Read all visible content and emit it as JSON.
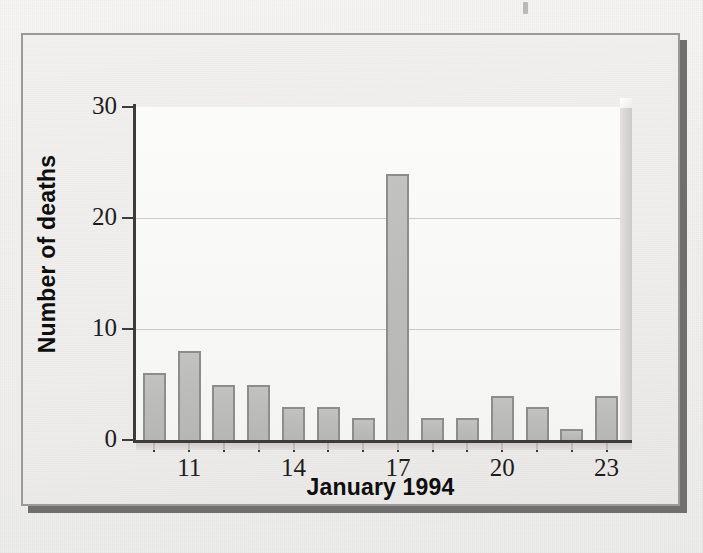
{
  "figure": {
    "alt_description": "Bar chart of number of deaths per day, January 1994"
  },
  "chart_data": {
    "type": "bar",
    "title": "",
    "subtitle": "",
    "xlabel": "January 1994",
    "ylabel": "Number of deaths",
    "categories": [
      "10",
      "11",
      "12",
      "13",
      "14",
      "15",
      "16",
      "17",
      "18",
      "19",
      "20",
      "21",
      "22",
      "23"
    ],
    "values": [
      6,
      8,
      5,
      5,
      3,
      3,
      2,
      24,
      2,
      2,
      4,
      3,
      1,
      4
    ],
    "series": [
      {
        "name": "Number of deaths",
        "values": [
          6,
          8,
          5,
          5,
          3,
          3,
          2,
          24,
          2,
          2,
          4,
          3,
          1,
          4
        ]
      }
    ],
    "ylim": [
      0,
      30
    ],
    "yticks": [
      0,
      10,
      20,
      30
    ],
    "ytick_labels": [
      "0",
      "10",
      "20",
      "30"
    ],
    "xtick_categories": [
      "11",
      "14",
      "17",
      "20",
      "23"
    ],
    "xtick_labels": [
      "11",
      "14",
      "17",
      "20",
      "23"
    ],
    "grid": "horizontal",
    "gridlines_at": [
      10,
      20
    ],
    "legend": "none",
    "annotations": [],
    "peak": {
      "category": "17",
      "value": 24
    },
    "colors": {
      "bar_fill": "#bcbcba",
      "bar_edge": "#8d8d8b",
      "axis": "#3c3c3c",
      "gridline": "#c9c9c7",
      "text": "#1d1d1d",
      "title_text": "#0e0e0e",
      "plot_background": "#f8f8f6",
      "figure_background": "#efeeec",
      "figure_border": "#9a9a98",
      "drop_shadow": "#6f6f6f"
    }
  },
  "ytick_labels": [
    "30",
    "20",
    "10",
    "0"
  ],
  "bleed_text": "A case-control study in Atlanta, Georgia, examined the relation between ambient air pollution and daily mortality. During the period of observation the investigators recorded the number of deaths occurring each day. The distribution shown in the accompanying figure summarizes the daily counts."
}
